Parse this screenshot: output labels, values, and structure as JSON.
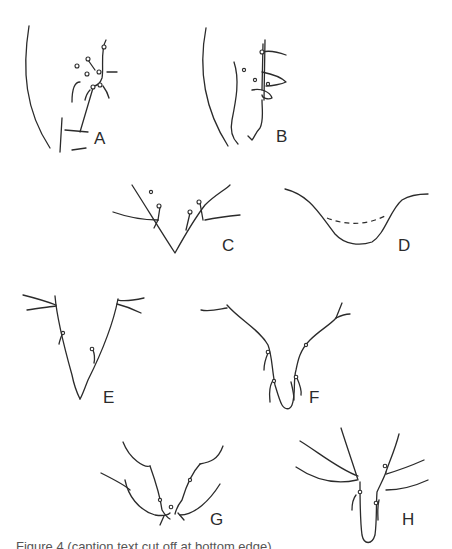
{
  "figure": {
    "panels": [
      {
        "id": "A",
        "label": "A"
      },
      {
        "id": "B",
        "label": "B"
      },
      {
        "id": "C",
        "label": "C"
      },
      {
        "id": "D",
        "label": "D"
      },
      {
        "id": "E",
        "label": "E"
      },
      {
        "id": "F",
        "label": "F"
      },
      {
        "id": "G",
        "label": "G"
      },
      {
        "id": "H",
        "label": "H"
      }
    ],
    "caption_partial": "Figure 4 (caption text cut off at bottom edge)",
    "line_color": "#2b2b2b",
    "background": "#ffffff"
  }
}
